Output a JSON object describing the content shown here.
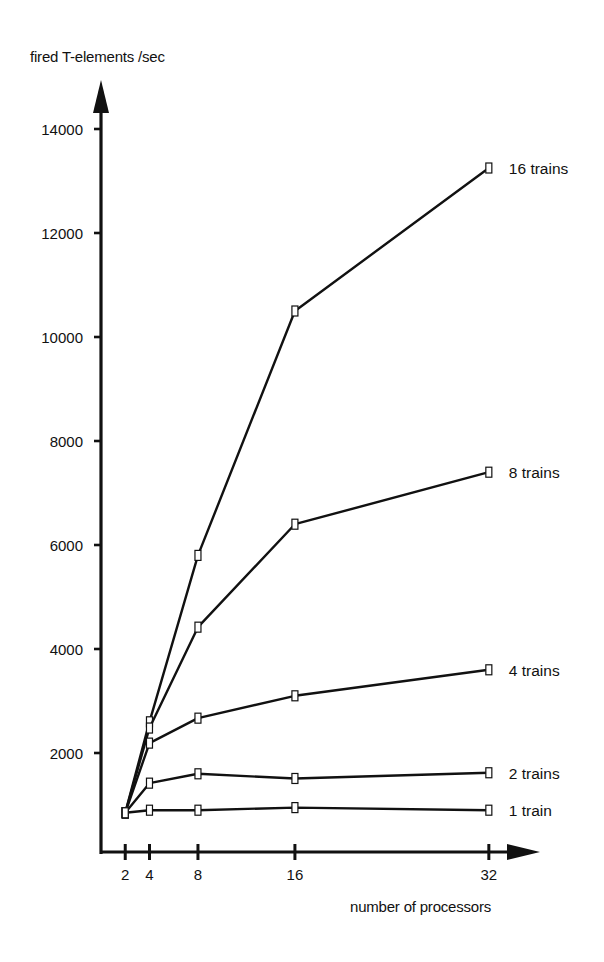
{
  "chart_data": {
    "type": "line",
    "title": "",
    "xlabel": "number of processors",
    "ylabel": "fired T-elements /sec",
    "x": [
      2,
      4,
      8,
      16,
      32
    ],
    "x_ticks": [
      2,
      4,
      8,
      16,
      32
    ],
    "y_ticks": [
      2000,
      4000,
      6000,
      8000,
      10000,
      12000,
      14000
    ],
    "xlim": [
      0,
      36
    ],
    "ylim": [
      0,
      15000
    ],
    "grid": false,
    "legend_position": "inline-right",
    "marker": "hollow-square",
    "series": [
      {
        "name": "16 trains",
        "values": [
          850,
          2600,
          5800,
          10500,
          13250
        ]
      },
      {
        "name": "8 trains",
        "values": [
          850,
          2480,
          4420,
          6400,
          7400
        ]
      },
      {
        "name": "4 trains",
        "values": [
          850,
          2190,
          2670,
          3100,
          3600
        ]
      },
      {
        "name": "2 trains",
        "values": [
          850,
          1420,
          1600,
          1510,
          1620
        ]
      },
      {
        "name": "1 train",
        "values": [
          850,
          900,
          900,
          950,
          900
        ]
      }
    ]
  },
  "axes": {
    "ylabel": "fired T-elements /sec",
    "xlabel": "number of processors"
  }
}
